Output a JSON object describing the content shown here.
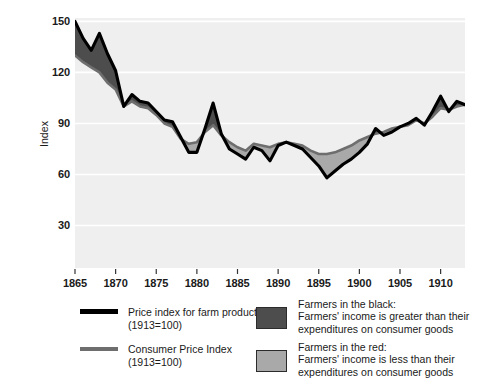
{
  "chart_data": {
    "type": "area",
    "title": "",
    "xlabel": "",
    "ylabel": "Index",
    "xlim": [
      1865,
      1913
    ],
    "ylim": [
      5,
      152
    ],
    "yticks": [
      30,
      60,
      90,
      120,
      150
    ],
    "xticks": [
      1865,
      1870,
      1875,
      1880,
      1885,
      1890,
      1895,
      1900,
      1905,
      1910
    ],
    "grid": true,
    "legend_position": "below",
    "x": [
      1865,
      1866,
      1867,
      1868,
      1869,
      1870,
      1871,
      1872,
      1873,
      1874,
      1875,
      1876,
      1877,
      1878,
      1879,
      1880,
      1881,
      1882,
      1883,
      1884,
      1885,
      1886,
      1887,
      1888,
      1889,
      1890,
      1891,
      1892,
      1893,
      1894,
      1895,
      1896,
      1897,
      1898,
      1899,
      1900,
      1901,
      1902,
      1903,
      1904,
      1905,
      1906,
      1907,
      1908,
      1909,
      1910,
      1911,
      1912,
      1913
    ],
    "series": [
      {
        "name": "Price index for farm products (1913=100)",
        "color": "#000000",
        "values": [
          150,
          140,
          133,
          143,
          131,
          121,
          100,
          107,
          103,
          102,
          97,
          92,
          91,
          82,
          73,
          73,
          87,
          102,
          84,
          75,
          72,
          69,
          76,
          74,
          68,
          77,
          79,
          77,
          75,
          70,
          65,
          58,
          62,
          66,
          69,
          73,
          78,
          87,
          83,
          85,
          88,
          90,
          93,
          89,
          97,
          106,
          97,
          103,
          101
        ]
      },
      {
        "name": "Consumer Price Index (1913=100)",
        "color": "#6e6e6e",
        "values": [
          130,
          126,
          123,
          120,
          114,
          110,
          100,
          103,
          100,
          99,
          95,
          90,
          88,
          81,
          78,
          79,
          85,
          89,
          83,
          79,
          76,
          74,
          78,
          77,
          76,
          78,
          79,
          78,
          77,
          74,
          72,
          72,
          73,
          75,
          77,
          80,
          82,
          84,
          85,
          87,
          88,
          89,
          92,
          90,
          94,
          99,
          98,
          100,
          101
        ]
      }
    ],
    "fills": [
      {
        "name": "Farmers in the black",
        "color": "#4d4d4d",
        "description": "Farm price index above Consumer Price Index"
      },
      {
        "name": "Farmers in the red",
        "color": "#a9a9a9",
        "description": "Farm price index below Consumer Price Index"
      }
    ],
    "plot_bg": "#efefef"
  },
  "axis": {
    "ylabel": "Index",
    "yticks": [
      "150",
      "120",
      "90",
      "60",
      "30"
    ],
    "xticks": [
      "1865",
      "1870",
      "1875",
      "1880",
      "1885",
      "1890",
      "1895",
      "1900",
      "1905",
      "1910"
    ]
  },
  "legend": {
    "lines": [
      {
        "swatch": "black-line-swatch",
        "line1": "Price index for farm products",
        "line2": "(1913=100)"
      },
      {
        "swatch": "grey-line-swatch",
        "line1": "Consumer Price Index",
        "line2": "(1913=100)"
      }
    ],
    "areas": [
      {
        "swatch": "dark-grey-box-swatch",
        "line1": "Farmers in the black:",
        "line2": "Farmers' income is greater than their",
        "line3": "expenditures on consumer goods"
      },
      {
        "swatch": "light-grey-box-swatch",
        "line1": "Farmers in the red:",
        "line2": "Farmers' income is less than their",
        "line3": "expenditures on consumer goods"
      }
    ]
  },
  "colors": {
    "farm_line": "#000000",
    "cpi_line": "#6e6e6e",
    "black_fill": "#4d4d4d",
    "red_fill": "#a9a9a9",
    "plot_background": "#efefef",
    "gridline": "#ffffff"
  }
}
